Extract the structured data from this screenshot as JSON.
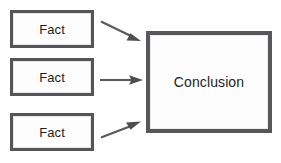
{
  "diagram": {
    "type": "flow",
    "background_color": "#ffffff",
    "border_color": "#555558",
    "text_color": "#1d1d1d",
    "arrow_color": "#5a5a5d",
    "nodes": [
      {
        "id": "fact1",
        "label": "Fact",
        "x": 10,
        "y": 10,
        "w": 84,
        "h": 38
      },
      {
        "id": "fact2",
        "label": "Fact",
        "x": 10,
        "y": 58,
        "w": 84,
        "h": 38
      },
      {
        "id": "fact3",
        "label": "Fact",
        "x": 10,
        "y": 113,
        "w": 84,
        "h": 38
      },
      {
        "id": "conclusion",
        "label": "Conclusion",
        "x": 146,
        "y": 31,
        "w": 126,
        "h": 102
      }
    ],
    "edges": [
      {
        "id": "edge1",
        "from": "fact1",
        "to": "conclusion",
        "direction": "down-right"
      },
      {
        "id": "edge2",
        "from": "fact2",
        "to": "conclusion",
        "direction": "right"
      },
      {
        "id": "edge3",
        "from": "fact3",
        "to": "conclusion",
        "direction": "up-right"
      }
    ]
  }
}
